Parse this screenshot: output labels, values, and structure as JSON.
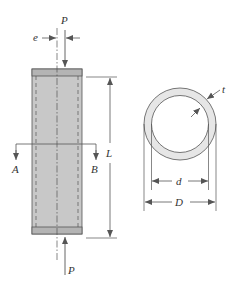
{
  "figure": {
    "column": {
      "labels": {
        "load_top": "P",
        "load_bottom": "P",
        "eccentricity": "e",
        "length": "L",
        "section_left": "A",
        "section_right": "B"
      }
    },
    "cross_section": {
      "labels": {
        "thickness": "t",
        "inner_diameter": "d",
        "outer_diameter": "D"
      }
    },
    "colors": {
      "fill": "#c8c8c8",
      "cap": "#b4b4b4",
      "ring_fill": "#e6e6e6",
      "line": "#555555",
      "text": "#333333"
    }
  }
}
